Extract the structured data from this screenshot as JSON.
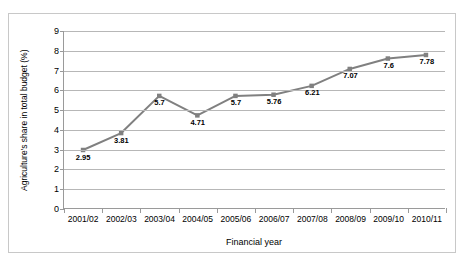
{
  "chart_data": {
    "type": "line",
    "title": "",
    "xlabel": "Financial year",
    "ylabel": "Agriculture's share in total budget (%)",
    "categories": [
      "2001/02",
      "2002/03",
      "2003/04",
      "2004/05",
      "2005/06",
      "2006/07",
      "2007/08",
      "2008/09",
      "2009/10",
      "2010/11"
    ],
    "values": [
      2.95,
      3.81,
      5.7,
      4.71,
      5.7,
      5.76,
      6.21,
      7.07,
      7.6,
      7.78
    ],
    "point_labels": [
      "2.95",
      "3.81",
      "5.7",
      "4.71",
      "5.7",
      "5.76",
      "6.21",
      "7.07",
      "7.6",
      "7.78"
    ],
    "ylim": [
      0,
      9
    ],
    "yticks": [
      0,
      1,
      2,
      3,
      4,
      5,
      6,
      7,
      8,
      9
    ],
    "ytick_labels": [
      "0",
      "1",
      "2",
      "3",
      "4",
      "5",
      "6",
      "7",
      "8",
      "9"
    ],
    "grid": true,
    "legend": false,
    "series_color": "#808080",
    "grid_color": "#b7b7b7",
    "axis_color": "#9a9a9a",
    "background": "#ffffff"
  }
}
